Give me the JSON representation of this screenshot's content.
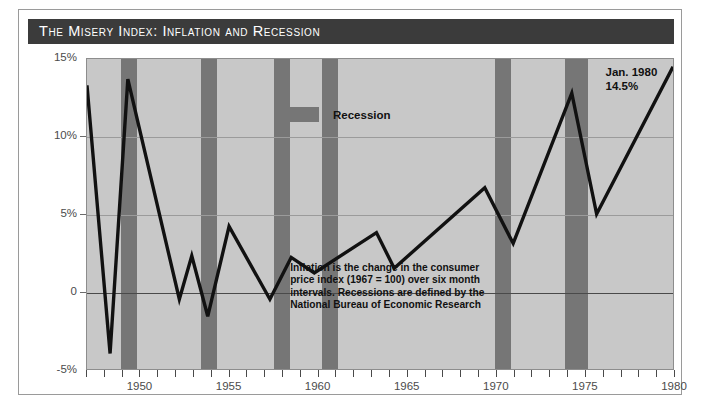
{
  "figure": {
    "title": "The Misery Index: Inflation and Recession"
  },
  "legend": {
    "position": "inside-top-center",
    "entries": [
      {
        "label": "Recession",
        "color": "#767676"
      }
    ]
  },
  "annotations": {
    "note": "Inflation is the change in the consumer price index (1967 = 100) over six month intervals. Recessions are defined by the National Bureau of Economic Research",
    "peak_callout_line1": "Jan. 1980",
    "peak_callout_line2": "14.5%"
  },
  "colors": {
    "title_bar": "#3b3b3b",
    "title_text": "#ffffff",
    "plot_background": "#c8c8c8",
    "recession_band": "#767676",
    "series_line": "#111111",
    "zero_line": "#4a4a4a",
    "grid_line": "#9b9b9b",
    "frame": "#8d8d8d",
    "axis_text": "#4b4b4b"
  },
  "chart_data": {
    "type": "line",
    "title": "The Misery Index: Inflation and Recession",
    "subtitle": "",
    "xlabel": "",
    "ylabel": "",
    "xlim": [
      1947,
      1980
    ],
    "ylim": [
      -5,
      15
    ],
    "grid": true,
    "y_ticks": [
      -5,
      0,
      5,
      10,
      15
    ],
    "y_tick_labels": [
      "-5%",
      "0",
      "5%",
      "10%",
      "15%"
    ],
    "x_ticks": [
      1950,
      1955,
      1960,
      1965,
      1970,
      1975,
      1980
    ],
    "x_tick_labels": [
      "1950",
      "1955",
      "1960",
      "1965",
      "1970",
      "1975",
      "1980"
    ],
    "x_minor_tick_step": 1,
    "series": [
      {
        "name": "Inflation (CPI, six-month change, annual rate)",
        "color": "#111111",
        "x": [
          1947.0,
          1948.3,
          1949.3,
          1950.4,
          1952.2,
          1952.9,
          1953.8,
          1954.8,
          1956.0,
          1957.9,
          1959.2,
          1960.1,
          1961.2,
          1965.8,
          1967.1,
          1969.6,
          1971.2,
          1974.3,
          1975.9,
          1980.0
        ],
        "y": [
          13.3,
          -4.0,
          13.7,
          -0.5,
          2.3,
          -1.6,
          4.2,
          -0.5,
          2.2,
          2.1,
          1.2,
          3.8,
          1.5,
          6.7,
          3.1,
          12.8,
          5.0,
          14.5,
          5.0,
          14.5
        ],
        "points": [
          {
            "x": 1947.0,
            "y": 13.3
          },
          {
            "x": 1948.3,
            "y": -4.0
          },
          {
            "x": 1949.3,
            "y": 13.7
          },
          {
            "x": 1952.2,
            "y": -0.5
          },
          {
            "x": 1952.9,
            "y": 2.3
          },
          {
            "x": 1953.8,
            "y": -1.6
          },
          {
            "x": 1955.0,
            "y": 4.2
          },
          {
            "x": 1957.3,
            "y": -0.5
          },
          {
            "x": 1958.5,
            "y": 2.2
          },
          {
            "x": 1959.8,
            "y": 1.2
          },
          {
            "x": 1963.3,
            "y": 3.8
          },
          {
            "x": 1964.3,
            "y": 1.5
          },
          {
            "x": 1969.4,
            "y": 6.7
          },
          {
            "x": 1971.0,
            "y": 3.1
          },
          {
            "x": 1974.3,
            "y": 12.8
          },
          {
            "x": 1975.7,
            "y": 5.0
          },
          {
            "x": 1980.0,
            "y": 14.5
          }
        ]
      }
    ],
    "shaded_regions": {
      "label": "Recession",
      "color": "#767676",
      "spans": [
        {
          "start": 1948.9,
          "end": 1949.8
        },
        {
          "start": 1953.4,
          "end": 1954.3
        },
        {
          "start": 1957.5,
          "end": 1958.4
        },
        {
          "start": 1960.2,
          "end": 1961.1
        },
        {
          "start": 1969.9,
          "end": 1970.8
        },
        {
          "start": 1973.8,
          "end": 1975.1
        }
      ]
    },
    "callouts": [
      {
        "text": "Jan. 1980 14.5%",
        "x": 1980.0,
        "y": 14.5
      }
    ]
  }
}
